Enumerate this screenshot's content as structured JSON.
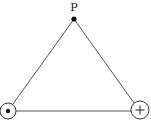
{
  "diagram": {
    "type": "equilateral-triangle-charges",
    "colors": {
      "stroke": "#444444",
      "ink": "#111111",
      "background": "#ffffff"
    },
    "apex": {
      "label": "P",
      "x": 74,
      "y": 19
    },
    "vertices": [
      {
        "name": "bottom-left",
        "symbol": "dot",
        "meaning": "out-of-page current / charge",
        "cx": 8,
        "cy": 111,
        "r": 8
      },
      {
        "name": "bottom-right",
        "symbol": "+",
        "meaning": "positive charge",
        "cx": 140,
        "cy": 110,
        "r": 9
      }
    ]
  }
}
